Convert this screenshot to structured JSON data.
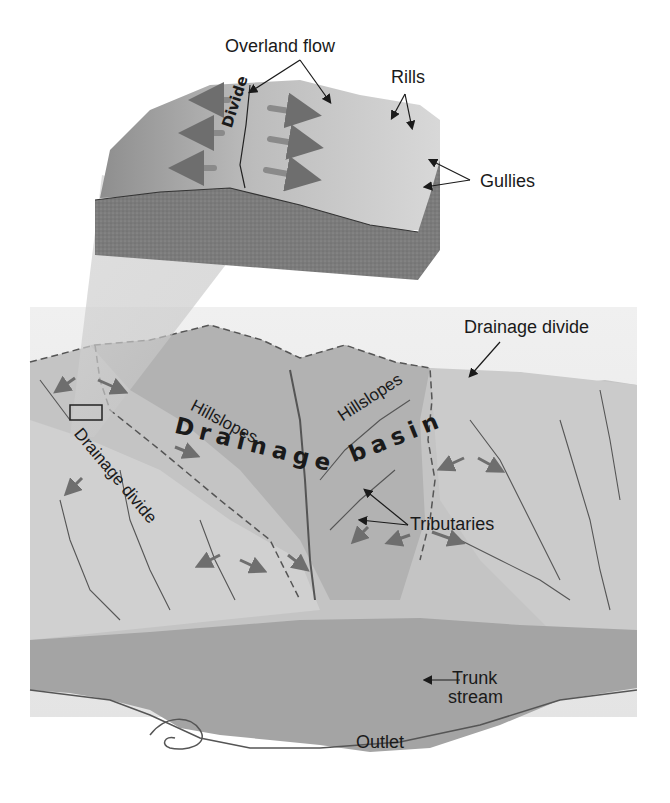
{
  "diagram": {
    "inset_block": {
      "labels": {
        "overland_flow": "Overland flow",
        "rills": "Rills",
        "gullies": "Gullies",
        "divide": "Divide"
      }
    },
    "basin": {
      "labels": {
        "drainage_divide_right": "Drainage divide",
        "drainage_divide_left": "Drainage divide",
        "hillslopes_left": "Hillslopes",
        "hillslopes_right": "Hillslopes",
        "drainage": "Drainage",
        "basin": "basin",
        "tributaries": "Tributaries",
        "trunk": "Trunk",
        "stream": "stream",
        "outlet": "Outlet"
      }
    },
    "colors": {
      "background": "#ffffff",
      "terrain_light": "#d2d2d2",
      "terrain_mid": "#b4b4b4",
      "terrain_dark": "#8c8c8c",
      "block_side": "#7a7a7a",
      "arrow": "#6e6e6e",
      "ink": "#1a1a1a"
    }
  }
}
